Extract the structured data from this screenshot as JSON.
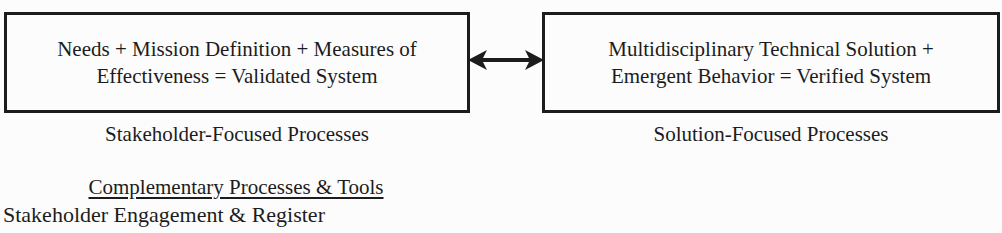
{
  "palette": {
    "background": "#fcfcfc",
    "ink": "#1c1c1c"
  },
  "boxes": {
    "left": {
      "lines": [
        "Needs + Mission Definition + Measures of",
        "Effectiveness = Validated System"
      ],
      "label": "Stakeholder-Focused Processes"
    },
    "right": {
      "lines": [
        "Multidisciplinary Technical Solution +",
        "Emergent Behavior = Verified System"
      ],
      "label": "Solution-Focused Processes"
    }
  },
  "connector": {
    "type": "double-headed-arrow"
  },
  "complementary": {
    "heading": "Complementary Processes & Tools",
    "items": [
      "Stakeholder Engagement & Register"
    ]
  }
}
